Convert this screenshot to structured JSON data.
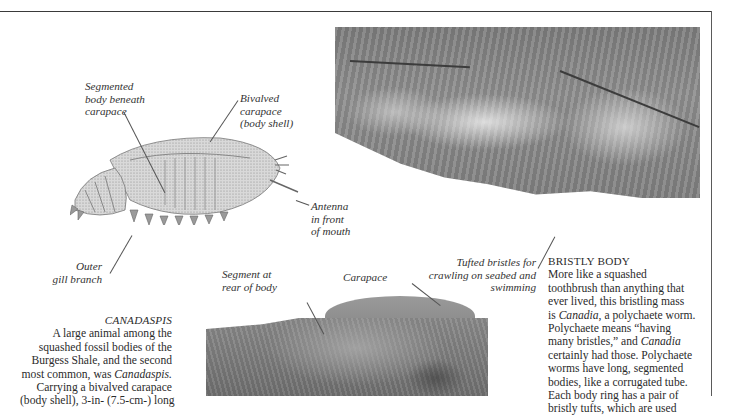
{
  "illustration": {
    "name": "Canadaspis reconstruction drawing",
    "labels": {
      "segmented_body": "Segmented\nbody beneath\ncarapace",
      "bivalved_carapace": "Bivalved\ncarapace\n(body shell)",
      "antenna": "Antenna\nin front\nof mouth",
      "outer_gill": "Outer\ngill branch"
    }
  },
  "fossil_bottom": {
    "labels": {
      "segment_rear": "Segment at\nrear of body",
      "carapace": "Carapace"
    }
  },
  "fossil_top": {
    "labels": {
      "tufted_bristles": "Tufted bristles for\ncrawling on seabed and\nswimming"
    }
  },
  "canadaspis_caption": {
    "heading": "CANADASPIS",
    "lines": [
      "A large animal among the",
      "squashed fossil bodies of the",
      "Burgess Shale, and the second",
      "most common, was ",
      "Carrying a bivalved carapace",
      "(body shell), 3-in- (7.5-cm-) long"
    ],
    "italic_term": "Canadaspis."
  },
  "bristly_caption": {
    "heading": "BRISTLY BODY",
    "lines": [
      "More like a squashed",
      "toothbrush than anything that",
      "ever lived, this bristling mass",
      "is ",
      "Polychaete means “having",
      "many bristles,” and ",
      "certainly had those. Polychaete",
      "worms have long, segmented",
      "bodies, like a corrugated tube.",
      "Each body ring has a pair of",
      "bristly tufts, which are used"
    ],
    "italic_canadia": "Canadia",
    "line4_rest": ", a polychaete worm.",
    "line6_italic": "Canadia"
  }
}
